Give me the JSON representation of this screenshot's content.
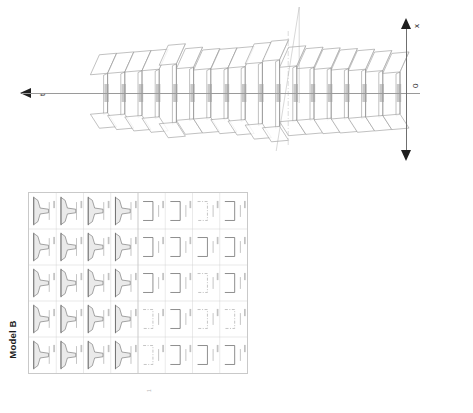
{
  "figure": {
    "caption": "Model B",
    "orientation": "rotated-90-ccw",
    "background_color": "#ffffff",
    "line_color": "#7d7d7d",
    "foot_mark": "1"
  },
  "waterfall": {
    "name": "waterfall-3d-plot",
    "t_axis_label": "t",
    "x_axis_label": "x",
    "origin_label": "0",
    "group_count": 2,
    "trace_count": 18,
    "separator_style": "dash-dot"
  },
  "subplot_grid": {
    "name": "subplot-grid",
    "rows": 5,
    "columns": 8,
    "left_block_columns": 4,
    "right_block_columns": 4,
    "left_block_style": "filled-pulse-trace",
    "right_block_style": "open-square-trace"
  },
  "chart_data": {
    "type": "line",
    "title": "Model B",
    "xlabel": "t",
    "ylabel": "x",
    "ylim": [
      -1,
      1
    ],
    "grid": false,
    "legend": "none",
    "annotations": [
      "0"
    ],
    "series": [
      {
        "name": "trace-01",
        "group": 1,
        "t": 0,
        "amplitude": 0.62
      },
      {
        "name": "trace-02",
        "group": 1,
        "t": 1,
        "amplitude": 0.66
      },
      {
        "name": "trace-03",
        "group": 1,
        "t": 2,
        "amplitude": 0.7
      },
      {
        "name": "trace-04",
        "group": 1,
        "t": 3,
        "amplitude": 0.72
      },
      {
        "name": "trace-05",
        "group": 1,
        "t": 4,
        "amplitude": 0.74
      },
      {
        "name": "trace-06",
        "group": 1,
        "t": 5,
        "amplitude": 0.76
      },
      {
        "name": "trace-07",
        "group": 1,
        "t": 6,
        "amplitude": 0.8
      },
      {
        "name": "trace-08",
        "group": 2,
        "t": 7,
        "amplitude": 0.98
      },
      {
        "name": "trace-09",
        "group": 2,
        "t": 8,
        "amplitude": 0.9
      },
      {
        "name": "trace-10",
        "group": 2,
        "t": 9,
        "amplitude": 0.78
      },
      {
        "name": "trace-11",
        "group": 2,
        "t": 10,
        "amplitude": 0.74
      },
      {
        "name": "trace-12",
        "group": 2,
        "t": 11,
        "amplitude": 0.72
      },
      {
        "name": "trace-13",
        "group": 2,
        "t": 12,
        "amplitude": 0.76
      },
      {
        "name": "trace-14",
        "group": 2,
        "t": 13,
        "amplitude": 0.86
      },
      {
        "name": "trace-15",
        "group": 2,
        "t": 14,
        "amplitude": 0.7
      },
      {
        "name": "trace-16",
        "group": 2,
        "t": 15,
        "amplitude": 0.66
      },
      {
        "name": "trace-17",
        "group": 2,
        "t": 16,
        "amplitude": 0.62
      },
      {
        "name": "trace-18",
        "group": 2,
        "t": 17,
        "amplitude": 0.58
      }
    ],
    "panels": [
      {
        "row": 1,
        "col": 1,
        "kind": "pulse"
      },
      {
        "row": 1,
        "col": 2,
        "kind": "pulse"
      },
      {
        "row": 1,
        "col": 3,
        "kind": "pulse"
      },
      {
        "row": 1,
        "col": 4,
        "kind": "pulse"
      },
      {
        "row": 1,
        "col": 5,
        "kind": "square"
      },
      {
        "row": 1,
        "col": 6,
        "kind": "square"
      },
      {
        "row": 1,
        "col": 7,
        "kind": "square-dashed"
      },
      {
        "row": 1,
        "col": 8,
        "kind": "square"
      },
      {
        "row": 2,
        "col": 1,
        "kind": "pulse"
      },
      {
        "row": 2,
        "col": 2,
        "kind": "pulse"
      },
      {
        "row": 2,
        "col": 3,
        "kind": "pulse"
      },
      {
        "row": 2,
        "col": 4,
        "kind": "pulse"
      },
      {
        "row": 2,
        "col": 5,
        "kind": "square"
      },
      {
        "row": 2,
        "col": 6,
        "kind": "square"
      },
      {
        "row": 2,
        "col": 7,
        "kind": "square"
      },
      {
        "row": 2,
        "col": 8,
        "kind": "square"
      },
      {
        "row": 3,
        "col": 1,
        "kind": "pulse"
      },
      {
        "row": 3,
        "col": 2,
        "kind": "pulse"
      },
      {
        "row": 3,
        "col": 3,
        "kind": "pulse"
      },
      {
        "row": 3,
        "col": 4,
        "kind": "pulse"
      },
      {
        "row": 3,
        "col": 5,
        "kind": "square"
      },
      {
        "row": 3,
        "col": 6,
        "kind": "square"
      },
      {
        "row": 3,
        "col": 7,
        "kind": "square-dashed"
      },
      {
        "row": 3,
        "col": 8,
        "kind": "square"
      },
      {
        "row": 4,
        "col": 1,
        "kind": "pulse"
      },
      {
        "row": 4,
        "col": 2,
        "kind": "pulse"
      },
      {
        "row": 4,
        "col": 3,
        "kind": "pulse"
      },
      {
        "row": 4,
        "col": 4,
        "kind": "pulse"
      },
      {
        "row": 4,
        "col": 5,
        "kind": "square-dashed"
      },
      {
        "row": 4,
        "col": 6,
        "kind": "square"
      },
      {
        "row": 4,
        "col": 7,
        "kind": "square-dashed"
      },
      {
        "row": 4,
        "col": 8,
        "kind": "square-dashed"
      },
      {
        "row": 5,
        "col": 1,
        "kind": "pulse"
      },
      {
        "row": 5,
        "col": 2,
        "kind": "pulse"
      },
      {
        "row": 5,
        "col": 3,
        "kind": "pulse"
      },
      {
        "row": 5,
        "col": 4,
        "kind": "pulse"
      },
      {
        "row": 5,
        "col": 5,
        "kind": "square-dashed"
      },
      {
        "row": 5,
        "col": 6,
        "kind": "square"
      },
      {
        "row": 5,
        "col": 7,
        "kind": "square"
      },
      {
        "row": 5,
        "col": 8,
        "kind": "square"
      }
    ]
  }
}
